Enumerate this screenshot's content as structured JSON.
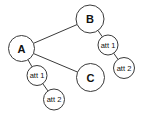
{
  "diagram": {
    "type": "entity-attribute graph",
    "colors": {
      "stroke": "#3a3a3a",
      "fill": "#ffffff",
      "text": "#111111"
    },
    "nodes": [
      {
        "id": "A",
        "label": "A",
        "kind": "entity",
        "cx": 21.5,
        "cy": 48.5,
        "r": 13
      },
      {
        "id": "B",
        "label": "B",
        "kind": "entity",
        "cx": 90,
        "cy": 19,
        "r": 14
      },
      {
        "id": "C",
        "label": "C",
        "kind": "entity",
        "cx": 90.5,
        "cy": 77.5,
        "r": 14
      },
      {
        "id": "A_att1",
        "label": "att 1",
        "kind": "attribute",
        "cx": 37,
        "cy": 75.5,
        "r": 10
      },
      {
        "id": "A_att2",
        "label": "att 2",
        "kind": "attribute",
        "cx": 54,
        "cy": 99.5,
        "r": 10.5
      },
      {
        "id": "B_att1",
        "label": "att 1",
        "kind": "attribute",
        "cx": 108,
        "cy": 45,
        "r": 10
      },
      {
        "id": "B_att2",
        "label": "att 2",
        "kind": "attribute",
        "cx": 124,
        "cy": 68,
        "r": 10.5
      }
    ],
    "edges": [
      {
        "from": "A",
        "to": "B"
      },
      {
        "from": "A",
        "to": "C"
      },
      {
        "from": "A",
        "to": "A_att1"
      },
      {
        "from": "A_att1",
        "to": "A_att2"
      },
      {
        "from": "B",
        "to": "B_att1"
      },
      {
        "from": "B_att1",
        "to": "B_att2"
      }
    ]
  }
}
